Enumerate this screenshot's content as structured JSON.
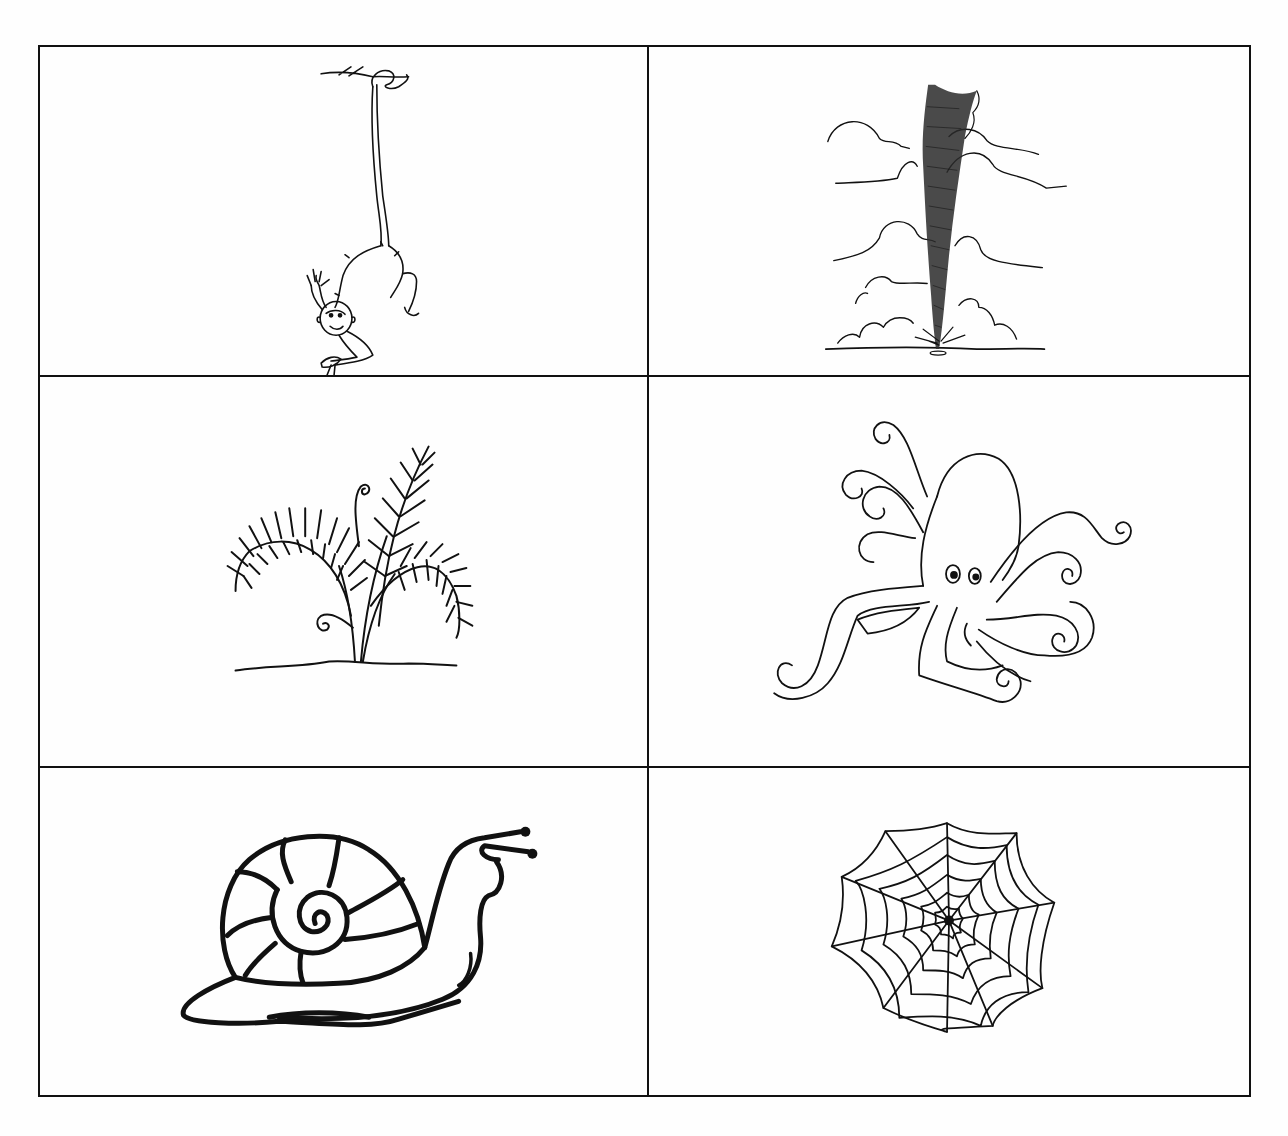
{
  "worksheet": {
    "layout": {
      "columns": 2,
      "rows": 3
    },
    "cells": [
      {
        "position": "row-1-left",
        "subject": "monkey",
        "icon": "monkey-icon",
        "description": "Monkey hanging by its tail from a branch, holding a banana"
      },
      {
        "position": "row-1-right",
        "subject": "tornado",
        "icon": "tornado-icon",
        "description": "Tornado funnel touching the ground among clouds"
      },
      {
        "position": "row-2-left",
        "subject": "fern",
        "icon": "fern-icon",
        "description": "Fern plant with fronds and curled fiddleheads"
      },
      {
        "position": "row-2-right",
        "subject": "octopus",
        "icon": "octopus-icon",
        "description": "Octopus with curly tentacles"
      },
      {
        "position": "row-3-left",
        "subject": "snail",
        "icon": "snail-icon",
        "description": "Snail with spiral shell"
      },
      {
        "position": "row-3-right",
        "subject": "spider web",
        "icon": "spider-web-icon",
        "description": "Spider web"
      }
    ],
    "colors": {
      "ink": "#111111",
      "paper": "#fefefe",
      "bleed_through": "#ececec"
    }
  }
}
